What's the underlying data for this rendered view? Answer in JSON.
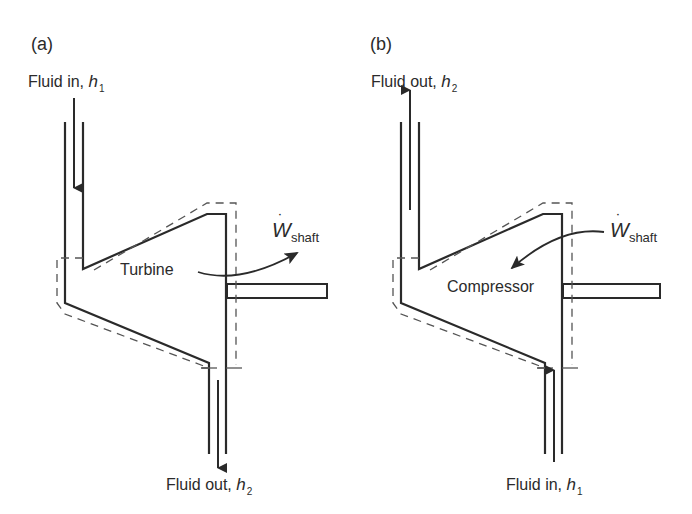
{
  "colors": {
    "stroke": "#2a2a2a",
    "dashed": "#555555",
    "background": "#ffffff"
  },
  "panels": [
    {
      "id": "a",
      "tag": "(a)",
      "component": "Turbine",
      "inlet": {
        "label": "Fluid in, ",
        "symbol": "h",
        "subscript": "1",
        "position": "top"
      },
      "outlet": {
        "label": "Fluid out, ",
        "symbol": "h",
        "subscript": "2",
        "position": "bottom"
      },
      "work": {
        "symbol": "W",
        "dot": "˙",
        "subscript": "shaft",
        "direction": "out"
      }
    },
    {
      "id": "b",
      "tag": "(b)",
      "component": "Compressor",
      "inlet": {
        "label": "Fluid in, ",
        "symbol": "h",
        "subscript": "1",
        "position": "bottom"
      },
      "outlet": {
        "label": "Fluid out, ",
        "symbol": "h",
        "subscript": "2",
        "position": "top"
      },
      "work": {
        "symbol": "W",
        "dot": "˙",
        "subscript": "shaft",
        "direction": "in"
      }
    }
  ]
}
